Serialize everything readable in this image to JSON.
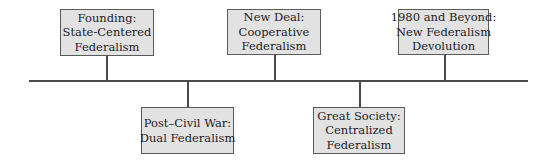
{
  "diagram": {
    "type": "timeline",
    "colors": {
      "box_fill": "#e2e2e2",
      "box_border": "#5a5a5a",
      "line": "#4a4a4a",
      "text": "#222222"
    },
    "eras": [
      {
        "position": "above",
        "lines": [
          "Founding:",
          "State-Centered",
          "Federalism"
        ]
      },
      {
        "position": "below",
        "lines": [
          "Post–Civil War:",
          "Dual Federalism"
        ]
      },
      {
        "position": "above",
        "lines": [
          "New Deal:",
          "Cooperative",
          "Federalism"
        ]
      },
      {
        "position": "below",
        "lines": [
          "Great Society:",
          "Centralized",
          "Federalism"
        ]
      },
      {
        "position": "above",
        "lines": [
          "1980 and Beyond:",
          "New Federalism",
          "Devolution"
        ]
      }
    ]
  }
}
